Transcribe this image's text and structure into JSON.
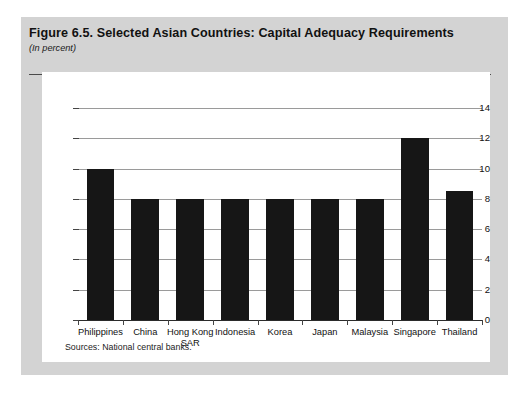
{
  "figure": {
    "title": "Figure 6.5.  Selected Asian Countries: Capital Adequacy Requirements",
    "subtitle": "(In percent)",
    "source_note": "Sources:  National central banks."
  },
  "colors": {
    "page_background": "#d3d3d3",
    "panel_background": "#ffffff",
    "bar_color": "#161616",
    "gridline_color": "#9a9a9a",
    "axis_color": "#2b2b2b",
    "text_color": "#111111"
  },
  "chart_data": {
    "type": "bar",
    "title": "Figure 6.5.  Selected Asian Countries: Capital Adequacy Requirements",
    "subtitle": "(In percent)",
    "categories": [
      "Philippines",
      "China",
      "Hong Kong SAR",
      "Indonesia",
      "Korea",
      "Japan",
      "Malaysia",
      "Singapore",
      "Thailand"
    ],
    "values": [
      10,
      8,
      8,
      8,
      8,
      8,
      8,
      12,
      8.5
    ],
    "xlabel": "",
    "ylabel": "",
    "ylim": [
      0,
      14
    ],
    "yticks": [
      0,
      2,
      4,
      6,
      8,
      10,
      12,
      14
    ],
    "ytick_labels": [
      "0",
      "2",
      "4",
      "6",
      "8",
      "10",
      "12",
      "14"
    ],
    "grid": true,
    "legend": false,
    "legend_position": "none",
    "source": "Sources:  National central banks."
  }
}
